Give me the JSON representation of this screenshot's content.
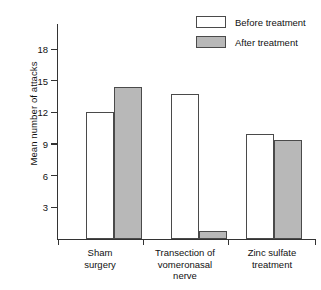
{
  "chart_data": {
    "type": "bar",
    "title": "",
    "subtitle": "",
    "xlabel": "",
    "ylabel": "Mean number of attacks",
    "categories": [
      "Sham surgery",
      "Transection of vomeronasal nerve",
      "Zinc sulfate treatment"
    ],
    "series": [
      {
        "name": "Before treatment",
        "color": "#ffffff",
        "values": [
          12.0,
          13.7,
          10.0
        ]
      },
      {
        "name": "After treatment",
        "color": "#b8b8b8",
        "values": [
          14.4,
          0.8,
          9.4
        ]
      }
    ],
    "ylim": [
      0,
      19.5
    ],
    "yticks": [
      3,
      6,
      9,
      12,
      15,
      18
    ],
    "ytick_labels": [
      "3",
      "6",
      "9",
      "12",
      "15",
      "18"
    ],
    "grid": false,
    "legend_position": "top-right"
  },
  "axis": {
    "y_title": "Mean number of attacks",
    "ticks": [
      {
        "value": 18,
        "label": "18"
      },
      {
        "value": 15,
        "label": "15"
      },
      {
        "value": 12,
        "label": "12"
      },
      {
        "value": 9,
        "label": "9"
      },
      {
        "value": 6,
        "label": "6"
      },
      {
        "value": 3,
        "label": "3"
      }
    ]
  },
  "categories": [
    {
      "id": "sham-surgery",
      "lines": [
        "Sham",
        "surgery"
      ]
    },
    {
      "id": "transection-vomeronasal-nerve",
      "lines": [
        "Transection of",
        "vomeronasal",
        "nerve"
      ]
    },
    {
      "id": "zinc-sulfate-treatment",
      "lines": [
        "Zinc sulfate",
        "treatment"
      ]
    }
  ],
  "legend": {
    "items": [
      {
        "id": "before-treatment",
        "label": "Before treatment",
        "swatch": "before"
      },
      {
        "id": "after-treatment",
        "label": "After treatment",
        "swatch": "after"
      }
    ]
  },
  "colors": {
    "before_fill": "#ffffff",
    "after_fill": "#b8b8b8",
    "bar_stroke": "#4a4a4a",
    "axis": "#333333",
    "background": "#ffffff"
  }
}
